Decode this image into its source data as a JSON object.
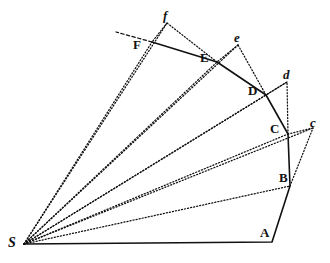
{
  "figure": {
    "name": "newton-principia-proposition-1-orbit-diagram",
    "type": "geometric-diagram",
    "background_color": "#ffffff",
    "ink_color": "#111111",
    "width": 330,
    "height": 263
  },
  "labels": [
    {
      "id": "S",
      "text": "S",
      "style": "origin",
      "x": 8,
      "y": 236,
      "point_x": 24,
      "point_y": 244
    },
    {
      "id": "A",
      "text": "A",
      "style": "upper",
      "x": 260,
      "y": 226,
      "point_x": 272,
      "point_y": 242
    },
    {
      "id": "B",
      "text": "B",
      "style": "upper",
      "x": 279,
      "y": 171,
      "point_x": 290,
      "point_y": 186
    },
    {
      "id": "C",
      "text": "C",
      "style": "upper",
      "x": 270,
      "y": 122,
      "point_x": 288,
      "point_y": 134
    },
    {
      "id": "D",
      "text": "D",
      "style": "upper",
      "x": 248,
      "y": 84,
      "point_x": 266,
      "point_y": 95
    },
    {
      "id": "E",
      "text": "E",
      "style": "upper",
      "x": 200,
      "y": 51,
      "point_x": 217,
      "point_y": 62
    },
    {
      "id": "F",
      "text": "F",
      "style": "upper",
      "x": 133,
      "y": 38,
      "point_x": 152,
      "point_y": 42
    },
    {
      "id": "c",
      "text": "c",
      "style": "lower",
      "x": 310,
      "y": 116,
      "point_x": 313,
      "point_y": 128
    },
    {
      "id": "d",
      "text": "d",
      "style": "lower",
      "x": 283,
      "y": 68,
      "point_x": 287,
      "point_y": 82
    },
    {
      "id": "e",
      "text": "e",
      "style": "lower",
      "x": 234,
      "y": 31,
      "point_x": 238,
      "point_y": 45
    },
    {
      "id": "f",
      "text": "f",
      "style": "lower",
      "x": 163,
      "y": 9,
      "point_x": 167,
      "point_y": 23
    }
  ],
  "points": {
    "S": {
      "x": 24,
      "y": 244
    },
    "A": {
      "x": 272,
      "y": 242
    },
    "B": {
      "x": 290,
      "y": 186
    },
    "C": {
      "x": 288,
      "y": 134
    },
    "D": {
      "x": 266,
      "y": 95
    },
    "E": {
      "x": 217,
      "y": 62
    },
    "F": {
      "x": 152,
      "y": 42
    },
    "b": {
      "x": 292,
      "y": 183
    },
    "c": {
      "x": 313,
      "y": 128
    },
    "d": {
      "x": 287,
      "y": 82
    },
    "e": {
      "x": 238,
      "y": 45
    },
    "f": {
      "x": 167,
      "y": 23
    },
    "V": {
      "x": 116,
      "y": 32
    }
  },
  "paths": {
    "orbit_polyline": {
      "name": "solid-orbit-path-S-A-B-C-D-E-F",
      "style": "solid",
      "stroke_width": 1.6,
      "vertices": [
        "S",
        "A",
        "B",
        "C",
        "D",
        "E",
        "F"
      ]
    },
    "radii": [
      {
        "name": "radius-S-B",
        "from": "S",
        "to": "B",
        "style": "dotted"
      },
      {
        "name": "radius-S-C",
        "from": "S",
        "to": "C",
        "style": "dotted"
      },
      {
        "name": "radius-S-D",
        "from": "S",
        "to": "D",
        "style": "dotted"
      },
      {
        "name": "radius-S-E",
        "from": "S",
        "to": "E",
        "style": "dotted"
      },
      {
        "name": "radius-S-F",
        "from": "S",
        "to": "F",
        "style": "dotted"
      },
      {
        "name": "radius-S-c",
        "from": "S",
        "to": "c",
        "style": "dotted"
      },
      {
        "name": "radius-S-d",
        "from": "S",
        "to": "d",
        "style": "dotted"
      },
      {
        "name": "radius-S-e",
        "from": "S",
        "to": "e",
        "style": "dotted"
      },
      {
        "name": "radius-S-f",
        "from": "S",
        "to": "f",
        "style": "dotted"
      }
    ],
    "tangent_segments": [
      {
        "name": "tangent-B-c",
        "from": "B",
        "to": "c",
        "style": "dotted"
      },
      {
        "name": "tangent-C-d",
        "from": "C",
        "to": "d",
        "style": "dotted"
      },
      {
        "name": "tangent-D-e",
        "from": "D",
        "to": "e",
        "style": "dotted"
      },
      {
        "name": "tangent-E-f",
        "from": "E",
        "to": "f",
        "style": "dotted"
      },
      {
        "name": "tangent-F-V",
        "from": "F",
        "to": "V",
        "style": "dashed"
      }
    ],
    "force_segments": [
      {
        "name": "force-c-C",
        "from": "c",
        "to": "C",
        "style": "dotted"
      },
      {
        "name": "force-d-D",
        "from": "d",
        "to": "D",
        "style": "dotted"
      },
      {
        "name": "force-e-E",
        "from": "e",
        "to": "E",
        "style": "dotted"
      },
      {
        "name": "force-f-F",
        "from": "f",
        "to": "F",
        "style": "dotted"
      }
    ]
  }
}
